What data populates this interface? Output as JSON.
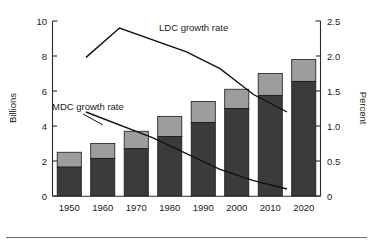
{
  "chart_data": {
    "type": "bar",
    "title": "",
    "subtitle": "",
    "xlabel": "",
    "ylabel": "Billions",
    "y2label": "Percent",
    "categories": [
      "1950",
      "1960",
      "1970",
      "1980",
      "1990",
      "2000",
      "2010",
      "2020"
    ],
    "ylim": [
      0,
      10
    ],
    "y2lim": [
      0,
      2.5
    ],
    "yticks": [
      "0",
      "2",
      "4",
      "6",
      "8",
      "10"
    ],
    "ytick_values": [
      0,
      2,
      4,
      6,
      8,
      10
    ],
    "y2ticks": [
      "0",
      "0.5",
      "1.0",
      "1.5",
      "2.0",
      "2.5"
    ],
    "y2tick_values": [
      0,
      0.5,
      1.0,
      1.5,
      2.0,
      2.5
    ],
    "grid": false,
    "legend_position": "inline-annotations",
    "stacked": true,
    "series": [
      {
        "name": "LDC population",
        "axis": "left",
        "color": "#3b3b3b",
        "values": [
          1.65,
          2.15,
          2.7,
          3.4,
          4.2,
          5.0,
          5.75,
          6.55
        ]
      },
      {
        "name": "MDC population",
        "axis": "left",
        "color": "#9d9d9d",
        "values": [
          0.85,
          0.85,
          1.0,
          1.15,
          1.2,
          1.1,
          1.25,
          1.25
        ]
      }
    ],
    "stacked_totals": [
      2.5,
      3.0,
      3.7,
      4.55,
      5.4,
      6.1,
      7.0,
      7.8
    ],
    "lines": [
      {
        "name": "LDC growth rate",
        "label": "LDC growth rate",
        "axis": "right",
        "color": "#111111",
        "x": [
          1955,
          1965,
          1985,
          1995,
          2005,
          2015
        ],
        "y": [
          1.98,
          2.4,
          2.06,
          1.82,
          1.45,
          1.2
        ]
      },
      {
        "name": "MDC growth rate",
        "label": "MDC growth rate",
        "axis": "right",
        "color": "#111111",
        "x": [
          1955,
          1975,
          1995,
          2005,
          2015
        ],
        "y": [
          1.2,
          0.83,
          0.38,
          0.22,
          0.1
        ]
      }
    ],
    "annotations": [
      {
        "text": "LDC growth rate",
        "x_px": 159,
        "y_px": 31
      },
      {
        "text": "MDC growth rate",
        "x_px": 52,
        "y_px": 110
      }
    ]
  }
}
